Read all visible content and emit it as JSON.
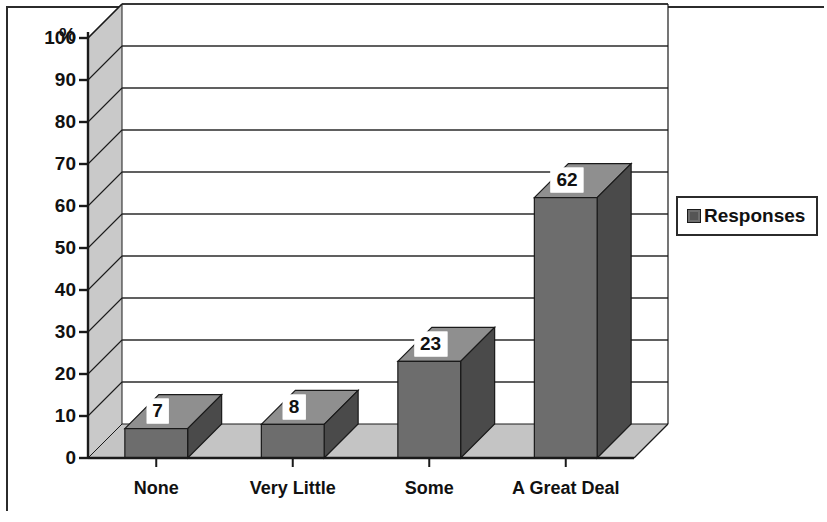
{
  "chart_data": {
    "type": "bar",
    "title": "",
    "subtitle": "",
    "xlabel": "",
    "ylabel": "%",
    "categories": [
      "None",
      "Very Little",
      "Some",
      "A Great Deal"
    ],
    "values": [
      7,
      8,
      23,
      62
    ],
    "series": [
      {
        "name": "Responses",
        "values": [
          7,
          8,
          23,
          62
        ]
      }
    ],
    "data_labels": [
      "7",
      "8",
      "23",
      "62"
    ],
    "ylim": [
      0,
      100
    ],
    "ytick_labels": [
      "0",
      "10",
      "20",
      "30",
      "40",
      "50",
      "60",
      "70",
      "80",
      "90",
      "100"
    ],
    "ytick_values": [
      0,
      10,
      20,
      30,
      40,
      50,
      60,
      70,
      80,
      90,
      100
    ],
    "grid": true,
    "grid_axis": "y",
    "legend": {
      "position": "right",
      "entries": [
        "Responses"
      ]
    },
    "style": "3d-column",
    "colors": {
      "bar_front": "#6d6d6d",
      "bar_side": "#4a4a4a",
      "bar_top": "#8f8f8f",
      "wall": "#c9c9c9",
      "floor": "#c4c4c4",
      "plot_background": "#ffffff",
      "gridline": "#2b2b2b",
      "axis": "#1a1a1a",
      "text": "#111111",
      "legend_swatch": "#555555"
    }
  },
  "legend": {
    "swatch_name": "legend-swatch",
    "label": "Responses"
  },
  "axis": {
    "y_unit_label": "%"
  }
}
